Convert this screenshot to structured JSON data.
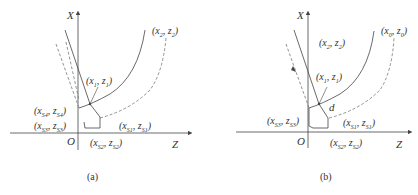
{
  "panels": [
    {
      "id": "a",
      "caption": "(a)",
      "axes": {
        "x_label": "X",
        "z_label": "Z",
        "origin_label": "O"
      },
      "points": {
        "p2": {
          "x": "x",
          "xs": "2",
          "z": "z",
          "zs": "2"
        },
        "p1": {
          "x": "x",
          "xs": "1",
          "z": "z",
          "zs": "1"
        },
        "s4": {
          "x": "x",
          "xs": "S4",
          "z": "z",
          "zs": "S4"
        },
        "s3": {
          "x": "x",
          "xs": "S3",
          "z": "z",
          "zs": "S3"
        },
        "s1": {
          "x": "x",
          "xs": "S1",
          "z": "z",
          "zs": "S1"
        },
        "s2": {
          "x": "x",
          "xs": "S2",
          "z": "z",
          "zs": "S2"
        }
      }
    },
    {
      "id": "b",
      "caption": "(b)",
      "axes": {
        "x_label": "X",
        "z_label": "Z",
        "origin_label": "O"
      },
      "distance_label": "d",
      "points": {
        "p0": {
          "x": "x",
          "xs": "0",
          "z": "z",
          "zs": "0"
        },
        "p2": {
          "x": "x",
          "xs": "2",
          "z": "z",
          "zs": "2"
        },
        "p1": {
          "x": "x",
          "xs": "1",
          "z": "z",
          "zs": "1"
        },
        "s3": {
          "x": "x",
          "xs": "S3",
          "z": "z",
          "zs": "S3"
        },
        "s1": {
          "x": "x",
          "xs": "S1",
          "z": "z",
          "zs": "S1"
        },
        "s2": {
          "x": "x",
          "xs": "S2",
          "z": "z",
          "zs": "S2"
        }
      }
    }
  ],
  "colors": {
    "line": "#444444",
    "dashed": "#777777",
    "background": "#ffffff"
  }
}
